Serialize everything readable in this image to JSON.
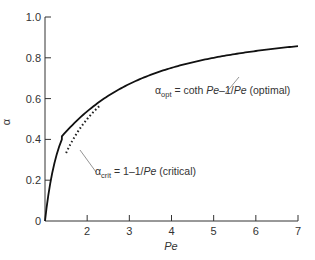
{
  "chart_data": {
    "type": "line",
    "title": "",
    "xlabel": "Pe",
    "ylabel": "α",
    "xlim": [
      1,
      7
    ],
    "ylim": [
      0,
      1.0
    ],
    "grid": false,
    "x_ticks": [
      "2",
      "3",
      "4",
      "5",
      "6",
      "7"
    ],
    "y_ticks": [
      "0",
      "0.2",
      "0.4",
      "0.6",
      "0.8",
      "1.0"
    ],
    "series": [
      {
        "name": "α_opt = coth Pe − 1/Pe (optimal)",
        "style": "solid",
        "formula": "coth(Pe) - 1/Pe",
        "x": [
          1.0,
          1.25,
          1.5,
          2.0,
          2.5,
          3.0,
          3.5,
          4.0,
          4.5,
          5.0,
          5.5,
          6.0,
          6.5,
          7.0
        ],
        "values": [
          0.313,
          0.376,
          0.431,
          0.537,
          0.614,
          0.672,
          0.716,
          0.751,
          0.778,
          0.8,
          0.818,
          0.833,
          0.846,
          0.857
        ]
      },
      {
        "name": "α_crit = 1 − 1/Pe (critical)",
        "style": "dotted",
        "formula": "1 - 1/Pe",
        "x": [
          1.5,
          1.75,
          2.0,
          2.25
        ],
        "values": [
          0.0,
          0.286,
          0.5,
          0.556
        ]
      }
    ],
    "annotations": [
      {
        "sub": "opt",
        "prefix": "α",
        "text": " = coth ",
        "italic1": "Pe",
        "mid": "–1/",
        "italic2": "Pe",
        "suffix": " (optimal)"
      },
      {
        "sub": "crit",
        "prefix": "α",
        "text": " = 1–1/",
        "italic1": "Pe",
        "suffix": " (critical)"
      }
    ],
    "legend": "inline annotations with leader lines"
  }
}
